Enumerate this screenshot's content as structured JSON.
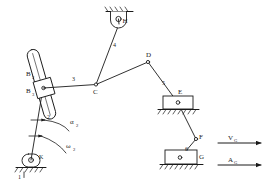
{
  "diagram": {
    "stroke_color": "#1a1a1a",
    "background": "#ffffff",
    "joints": [
      {
        "id": "K",
        "label": "K",
        "x": 31,
        "y": 160,
        "type": "ground-pivot"
      },
      {
        "id": "B",
        "label": "B₃",
        "x": 43,
        "y": 88,
        "type": "slider-pin"
      },
      {
        "id": "B2",
        "label": "B₂",
        "x": 34,
        "y": 74,
        "type": "label-only"
      },
      {
        "id": "C",
        "label": "C",
        "x": 96,
        "y": 85,
        "type": "pin"
      },
      {
        "id": "D",
        "label": "D",
        "x": 148,
        "y": 62,
        "type": "pin"
      },
      {
        "id": "E",
        "label": "E",
        "x": 178,
        "y": 103,
        "type": "slider-pin"
      },
      {
        "id": "F",
        "label": "F",
        "x": 196,
        "y": 139,
        "type": "pin"
      },
      {
        "id": "G",
        "label": "G",
        "x": 180,
        "y": 158,
        "type": "slider-pin"
      },
      {
        "id": "H",
        "label": "H",
        "x": 119,
        "y": 20,
        "type": "ground-pivot"
      }
    ],
    "links": [
      {
        "number": "1",
        "label_x": 20,
        "label_y": 178,
        "name": "frame"
      },
      {
        "number": "2",
        "label_x": 48,
        "label_y": 117,
        "name": "crank-slider-bar"
      },
      {
        "number": "3",
        "label_x": 74,
        "label_y": 80,
        "name": "coupler-BC"
      },
      {
        "number": "4",
        "label_x": 113,
        "label_y": 45,
        "name": "rocker-HC"
      },
      {
        "number": "5",
        "label_x": 163,
        "label_y": 84,
        "name": "coupler-DE"
      },
      {
        "number": "6",
        "label_x": 186,
        "label_y": 150,
        "name": "coupler-FG"
      }
    ],
    "annotations": [
      {
        "id": "omega2",
        "base": "ω",
        "sub": "2",
        "x": 62,
        "y": 150
      },
      {
        "id": "alpha2",
        "base": "α",
        "sub": "2",
        "x": 65,
        "y": 123
      }
    ],
    "vectors": [
      {
        "id": "vG",
        "base": "V",
        "sub": "G",
        "label_x": 228,
        "label_y": 136,
        "y_line": 143,
        "x1": 218,
        "x2": 262
      },
      {
        "id": "aG",
        "base": "A",
        "sub": "G",
        "label_x": 228,
        "label_y": 158,
        "y_line": 165,
        "x1": 218,
        "x2": 262
      }
    ]
  }
}
